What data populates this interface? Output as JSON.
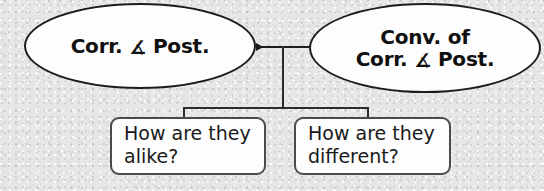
{
  "diagram": {
    "type": "comparison-tree",
    "background_color": "#e6e6e6",
    "stroke_color": "#1c1c1c",
    "fill_color": "#fdfdfd",
    "text_color": "#101010",
    "nodes": {
      "left_ellipse": {
        "label": "Corr. ∡ Post.",
        "line1_before_symbol": "Corr.",
        "symbol": "∡",
        "line1_after_symbol": "Post.",
        "shape": "ellipse"
      },
      "right_ellipse": {
        "label": "Conv. of Corr. ∡ Post.",
        "line1": "Conv. of",
        "line2_before_symbol": "Corr.",
        "symbol": "∡",
        "line2_after_symbol": "Post.",
        "shape": "ellipse"
      },
      "left_box": {
        "label": "How are they alike?",
        "line1": "How are they",
        "line2": "alike?",
        "shape": "rounded-rectangle"
      },
      "right_box": {
        "label": "How are they different?",
        "line1": "How are they",
        "line2": "different?",
        "shape": "rounded-rectangle"
      }
    },
    "connectors": {
      "ellipse_link": {
        "name": "double-headed-arrow",
        "from": "left_ellipse",
        "to": "right_ellipse",
        "arrowheads": "both"
      },
      "trunk": {
        "name": "vertical-trunk",
        "from": "ellipse_link-midpoint",
        "to": "branch-bar"
      },
      "branch_left": {
        "name": "branch-to-left-box",
        "to": "left_box"
      },
      "branch_right": {
        "name": "branch-to-right-box",
        "to": "right_box"
      }
    }
  }
}
